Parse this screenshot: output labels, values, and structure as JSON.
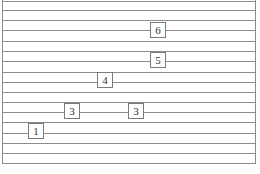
{
  "diagram": {
    "type": "ruled-sheet-with-number-boxes",
    "colors": {
      "rule": "#8c8c8c",
      "box_border": "#7a7a7a",
      "text": "#333333",
      "background": "#ffffff"
    },
    "rules_y": [
      1,
      10,
      20,
      30,
      41,
      51,
      61,
      72,
      82,
      92,
      102,
      112,
      122,
      133,
      143,
      153
    ],
    "boxes": [
      {
        "label": "6",
        "x": 150,
        "y": 22
      },
      {
        "label": "5",
        "x": 150,
        "y": 52
      },
      {
        "label": "4",
        "x": 97,
        "y": 72
      },
      {
        "label": "3",
        "x": 64,
        "y": 103
      },
      {
        "label": "3",
        "x": 128,
        "y": 103
      },
      {
        "label": "1",
        "x": 28,
        "y": 123
      }
    ]
  }
}
